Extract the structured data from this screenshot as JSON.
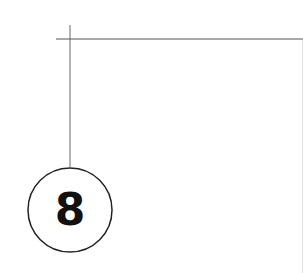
{
  "diagram": {
    "callout_number": "8",
    "line_color": "#555555",
    "circle_stroke": "#222222",
    "text_color": "#111111"
  }
}
